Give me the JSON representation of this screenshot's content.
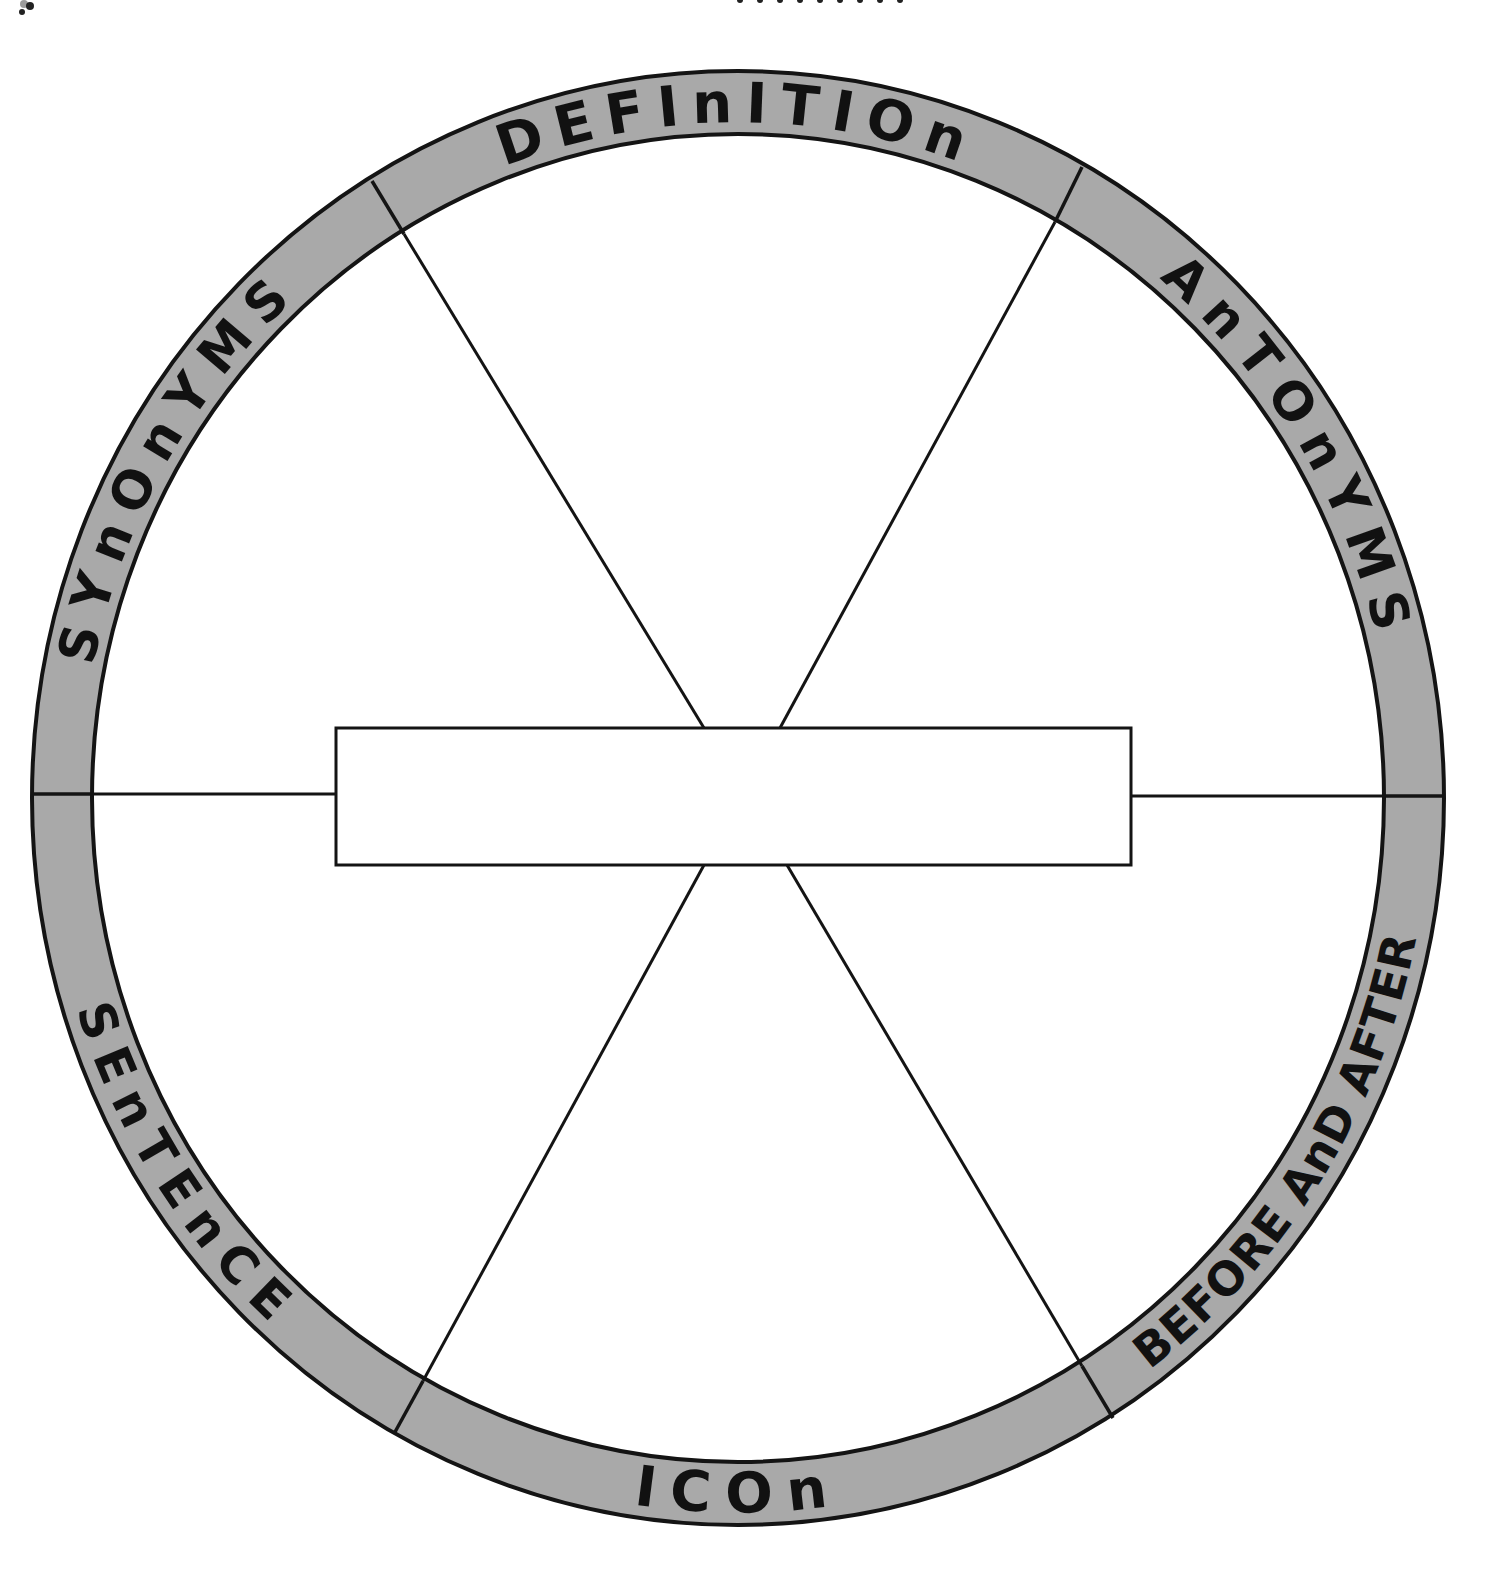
{
  "diagram": {
    "type": "vocabulary word wheel",
    "center_box": {
      "value": "",
      "placeholder": ""
    },
    "sections": [
      {
        "id": "definition",
        "label": "DEFInITIOn",
        "position": "top"
      },
      {
        "id": "antonyms",
        "label": "AnTOnYMS",
        "position": "upper-right"
      },
      {
        "id": "before-and-after",
        "label": "BEFORE AnD AFTER",
        "position": "lower-right"
      },
      {
        "id": "icon",
        "label": "ICOn",
        "position": "bottom"
      },
      {
        "id": "sentence",
        "label": "SEnTEnCE",
        "position": "lower-left"
      },
      {
        "id": "synonyms",
        "label": "SYnOnYMS",
        "position": "upper-left"
      }
    ],
    "colors": {
      "ring": "#a9a9a9",
      "ink": "#141414",
      "background": "#ffffff"
    }
  }
}
